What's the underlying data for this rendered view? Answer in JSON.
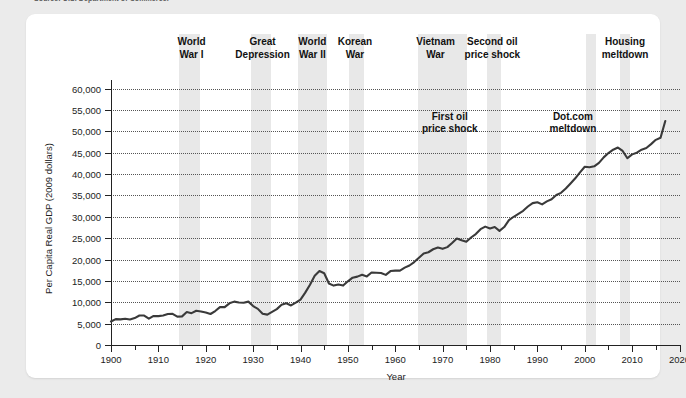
{
  "source_note": "Source: U.S. Department of Commerce.",
  "card": {
    "xlabel": "Year",
    "ylabel": "Per Capita Real GDP (2009 dollars)"
  },
  "axis": {
    "y_ticks": [
      "0",
      "5,000",
      "10,000",
      "15,000",
      "20,000",
      "25,000",
      "30,000",
      "35,000",
      "40,000",
      "45,000",
      "50,000",
      "55,000",
      "60,000"
    ],
    "x_ticks": [
      "1900",
      "1910",
      "1920",
      "1930",
      "1940",
      "1950",
      "1960",
      "1970",
      "1980",
      "1990",
      "2000",
      "2010",
      "2020"
    ]
  },
  "annotations_top": [
    {
      "text": "World\nWar I",
      "year": 1917
    },
    {
      "text": "Great\nDepression",
      "year": 1932
    },
    {
      "text": "World\nWar II",
      "year": 1942.5
    },
    {
      "text": "Korean\nWar",
      "year": 1951.5
    },
    {
      "text": "Vietnam\nWar",
      "year": 1968.5
    },
    {
      "text": "Second oil\nprice shock",
      "year": 1980.5
    },
    {
      "text": "Housing\nmeltdown",
      "year": 2008.5
    }
  ],
  "annotations_inner": [
    {
      "text": "First oil\nprice shock",
      "year": 1971.5,
      "value": 53400
    },
    {
      "text": "Dot.com\nmeltdown",
      "year": 1997.5,
      "value": 53400
    }
  ],
  "shaded_bands": [
    {
      "name": "world-war-i",
      "start": 1914.3,
      "end": 1918.8
    },
    {
      "name": "great-depression",
      "start": 1929.5,
      "end": 1933.8
    },
    {
      "name": "world-war-ii",
      "start": 1939.5,
      "end": 1945.5
    },
    {
      "name": "korean-war",
      "start": 1950.3,
      "end": 1953.5
    },
    {
      "name": "vietnam-war",
      "start": 1964.8,
      "end": 1973.2
    },
    {
      "name": "first-oil-price-shock",
      "start": 1973.3,
      "end": 1975.2
    },
    {
      "name": "second-oil-price-shock",
      "start": 1979.3,
      "end": 1982.3
    },
    {
      "name": "dot-com-meltdown",
      "start": 2000.3,
      "end": 2002.3
    },
    {
      "name": "housing-meltdown",
      "start": 2007.5,
      "end": 2009.6
    }
  ],
  "chart_data": {
    "type": "line",
    "title": "",
    "xlabel": "Year",
    "ylabel": "Per Capita Real GDP (2009 dollars)",
    "xlim": [
      1900,
      2020
    ],
    "ylim": [
      0,
      62000
    ],
    "grid": true,
    "legend": "none",
    "line_color": "#3a3a3a",
    "band_color": "#e8e8e8",
    "x": [
      1900,
      1901,
      1902,
      1903,
      1904,
      1905,
      1906,
      1907,
      1908,
      1909,
      1910,
      1911,
      1912,
      1913,
      1914,
      1915,
      1916,
      1917,
      1918,
      1919,
      1920,
      1921,
      1922,
      1923,
      1924,
      1925,
      1926,
      1927,
      1928,
      1929,
      1930,
      1931,
      1932,
      1933,
      1934,
      1935,
      1936,
      1937,
      1938,
      1939,
      1940,
      1941,
      1942,
      1943,
      1944,
      1945,
      1946,
      1947,
      1948,
      1949,
      1950,
      1951,
      1952,
      1953,
      1954,
      1955,
      1956,
      1957,
      1958,
      1959,
      1960,
      1961,
      1962,
      1963,
      1964,
      1965,
      1966,
      1967,
      1968,
      1969,
      1970,
      1971,
      1972,
      1973,
      1974,
      1975,
      1976,
      1977,
      1978,
      1979,
      1980,
      1981,
      1982,
      1983,
      1984,
      1985,
      1986,
      1987,
      1988,
      1989,
      1990,
      1991,
      1992,
      1993,
      1994,
      1995,
      1996,
      1997,
      1998,
      1999,
      2000,
      2001,
      2002,
      2003,
      2004,
      2005,
      2006,
      2007,
      2008,
      2009,
      2010,
      2011,
      2012,
      2013,
      2014,
      2015,
      2016,
      2017
    ],
    "y": [
      5500,
      6050,
      6000,
      6150,
      5950,
      6300,
      6900,
      6900,
      6150,
      6800,
      6750,
      6900,
      7250,
      7300,
      6650,
      6700,
      7700,
      7450,
      8000,
      7850,
      7600,
      7250,
      7950,
      8850,
      8850,
      9750,
      10150,
      9950,
      9900,
      10150,
      9100,
      8450,
      7300,
      7100,
      7750,
      8400,
      9400,
      9750,
      9250,
      9900,
      10600,
      12250,
      14100,
      16200,
      17300,
      16800,
      14400,
      13900,
      14150,
      13900,
      14900,
      15750,
      16000,
      16450,
      16050,
      16950,
      16900,
      16850,
      16400,
      17300,
      17400,
      17400,
      18100,
      18600,
      19400,
      20400,
      21400,
      21700,
      22400,
      22800,
      22500,
      22900,
      23850,
      24900,
      24500,
      24150,
      25150,
      25950,
      27100,
      27700,
      27250,
      27600,
      26700,
      27600,
      29200,
      30000,
      30700,
      31400,
      32400,
      33200,
      33400,
      32900,
      33600,
      34100,
      35100,
      35600,
      36600,
      37800,
      39000,
      40400,
      41700,
      41600,
      41800,
      42600,
      43900,
      44900,
      45700,
      46200,
      45400,
      43700,
      44600,
      45000,
      45700,
      46100,
      47000,
      48000,
      48500,
      52400
    ]
  }
}
